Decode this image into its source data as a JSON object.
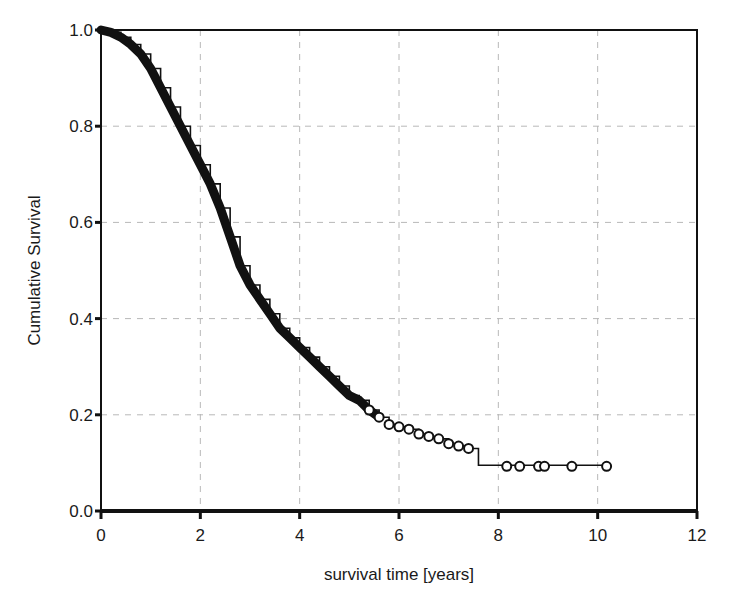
{
  "chart_data": {
    "type": "line",
    "subtype": "kaplan-meier-step",
    "title": "",
    "xlabel": "survival time [years]",
    "ylabel": "Cumulative Survival",
    "xlim": [
      0,
      12
    ],
    "ylim": [
      0.0,
      1.0
    ],
    "xticks": [
      0,
      2,
      4,
      6,
      8,
      10,
      12
    ],
    "yticks": [
      0.0,
      0.2,
      0.4,
      0.6,
      0.8,
      1.0
    ],
    "xtick_labels": [
      "0",
      "2",
      "4",
      "6",
      "8",
      "10",
      "12"
    ],
    "ytick_labels": [
      "0.0",
      "0.2",
      "0.4",
      "0.6",
      "0.8",
      "1.0"
    ],
    "grid": true,
    "grid_style": "dashed",
    "legend": null,
    "series": [
      {
        "name": "Cumulative Survival",
        "x": [
          0.0,
          0.2,
          0.4,
          0.6,
          0.8,
          1.0,
          1.2,
          1.4,
          1.6,
          1.8,
          2.0,
          2.2,
          2.4,
          2.6,
          2.8,
          3.0,
          3.2,
          3.4,
          3.6,
          3.8,
          4.0,
          4.2,
          4.4,
          4.6,
          4.8,
          5.0,
          5.2,
          5.4,
          5.6,
          5.8,
          6.0,
          6.2,
          6.4,
          6.6,
          6.8,
          7.0,
          7.2,
          7.4,
          7.6,
          8.0,
          8.5,
          9.0,
          9.5,
          10.2
        ],
        "values": [
          1.0,
          0.995,
          0.985,
          0.97,
          0.95,
          0.92,
          0.88,
          0.84,
          0.8,
          0.76,
          0.72,
          0.68,
          0.63,
          0.57,
          0.51,
          0.47,
          0.44,
          0.41,
          0.38,
          0.36,
          0.34,
          0.32,
          0.3,
          0.28,
          0.26,
          0.24,
          0.23,
          0.21,
          0.195,
          0.18,
          0.175,
          0.17,
          0.16,
          0.155,
          0.15,
          0.14,
          0.135,
          0.13,
          0.095,
          0.095,
          0.095,
          0.095,
          0.095,
          0.095
        ]
      }
    ],
    "censored_marks_tail": {
      "x": [
        8.17,
        8.43,
        8.81,
        8.93,
        9.48,
        10.18
      ],
      "y": 0.093
    },
    "colors": {
      "curve": "#111111",
      "grid": "#b8b8b8",
      "axis": "#111111",
      "background": "#ffffff"
    }
  }
}
